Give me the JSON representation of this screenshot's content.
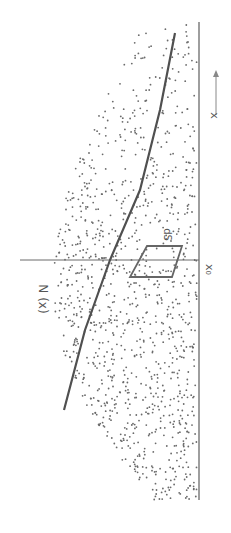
{
  "diagram": {
    "type": "scatter-density-diagram",
    "orientation": "rotated-90-clockwise",
    "labels": {
      "curve": "N (x)",
      "axis_arrow": "x",
      "origin_tick": "x₀",
      "element": "dS"
    },
    "colors": {
      "background": "#ffffff",
      "dots": "#6a6a6a",
      "curve": "#505050",
      "axis": "#6a6a6a",
      "element_box": "#666666",
      "text": "#555555"
    },
    "geometry": {
      "baseline": {
        "x": 199,
        "y1": 22,
        "y2": 500
      },
      "x0_line": {
        "y": 260,
        "x1": 20,
        "x2": 199
      },
      "curve_points": [
        [
          175,
          33
        ],
        [
          160,
          110
        ],
        [
          140,
          190
        ],
        [
          110,
          260
        ],
        [
          85,
          330
        ],
        [
          64,
          410
        ]
      ],
      "element_box": [
        [
          147,
          246
        ],
        [
          182,
          246
        ],
        [
          172,
          277
        ],
        [
          130,
          277
        ]
      ],
      "arrow": {
        "x": 216,
        "y_tail": 115,
        "y_head": 70
      }
    }
  }
}
